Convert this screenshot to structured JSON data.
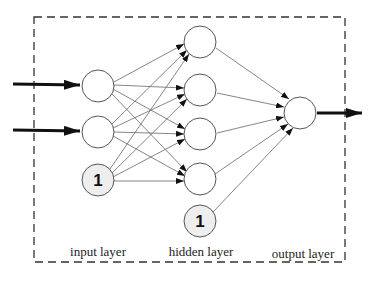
{
  "diagram": {
    "type": "neural-network",
    "labels": {
      "input_layer": "input layer",
      "hidden_layer": "hidden layer",
      "output_layer": "output layer"
    },
    "bias_label": "1",
    "layers": {
      "input": {
        "nodes": 2,
        "bias": true
      },
      "hidden": {
        "nodes": 4,
        "bias": true
      },
      "output": {
        "nodes": 1
      }
    },
    "colors": {
      "node_fill": "#ffffff",
      "bias_fill": "#eeeeee",
      "stroke": "#555555",
      "arrow": "#111111",
      "border": "#333333"
    }
  }
}
